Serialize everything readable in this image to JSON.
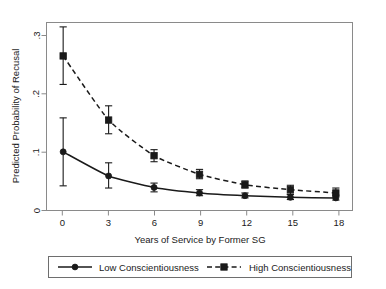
{
  "chart_data": {
    "type": "line",
    "title": "",
    "xlabel": "Years of Service by Former SG",
    "ylabel": "Predicted Probability of Recusal",
    "x": [
      0,
      3,
      6,
      9,
      12,
      15,
      18
    ],
    "xtick_labels": [
      "0",
      "3",
      "6",
      "9",
      "12",
      "15",
      "18"
    ],
    "ytick_labels": [
      "0",
      ".1",
      ".2",
      ".3"
    ],
    "ytick_values": [
      0,
      0.1,
      0.2,
      0.3
    ],
    "xlim": [
      -1.1,
      19.1
    ],
    "ylim": [
      -0.018,
      0.325
    ],
    "grid": false,
    "legend_position": "below-axis-title",
    "series": [
      {
        "name": "Low Conscientiousness",
        "linestyle": "solid",
        "marker": "circle",
        "color": "#1a1a1a",
        "values": [
          0.089,
          0.045,
          0.024,
          0.014,
          0.009,
          0.006,
          0.005
        ],
        "ci_low": [
          0.027,
          0.023,
          0.016,
          0.009,
          0.005,
          0.002,
          0.001
        ],
        "ci_high": [
          0.151,
          0.069,
          0.032,
          0.02,
          0.014,
          0.011,
          0.01
        ]
      },
      {
        "name": "High Conscientiousness",
        "linestyle": "dashed",
        "marker": "square",
        "color": "#1a1a1a",
        "values": [
          0.264,
          0.147,
          0.082,
          0.048,
          0.029,
          0.02,
          0.014
        ],
        "ci_low": [
          0.212,
          0.122,
          0.071,
          0.04,
          0.023,
          0.012,
          0.007
        ],
        "ci_high": [
          0.317,
          0.173,
          0.093,
          0.057,
          0.036,
          0.028,
          0.023
        ]
      }
    ]
  },
  "legend": {
    "entries": [
      {
        "label": "Low Conscientiousness"
      },
      {
        "label": "High Conscientiousness"
      }
    ]
  },
  "colors": {
    "line": "#1a1a1a",
    "axis": "#7d7d7d",
    "frame": "#7d7d7d",
    "background": "#ffffff",
    "legend_border": "#6e6e6e"
  }
}
